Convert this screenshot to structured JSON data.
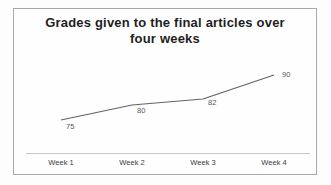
{
  "title_lines": [
    "Grades given to the final articles over",
    "four weeks"
  ],
  "chart_data": {
    "type": "line",
    "title": "Grades given to the final articles over four weeks",
    "categories": [
      "Week 1",
      "Week 2",
      "Week 3",
      "Week 4"
    ],
    "values": [
      75,
      80,
      82,
      90
    ],
    "xlabel": "",
    "ylabel": "",
    "ylim": [
      70,
      95
    ],
    "grid": false,
    "legend": "none",
    "data_labels": true,
    "line_color": "#636363",
    "label_color": "#565656",
    "title_color": "#1e1e1e",
    "frame_border_color": "#a9a9a9"
  }
}
